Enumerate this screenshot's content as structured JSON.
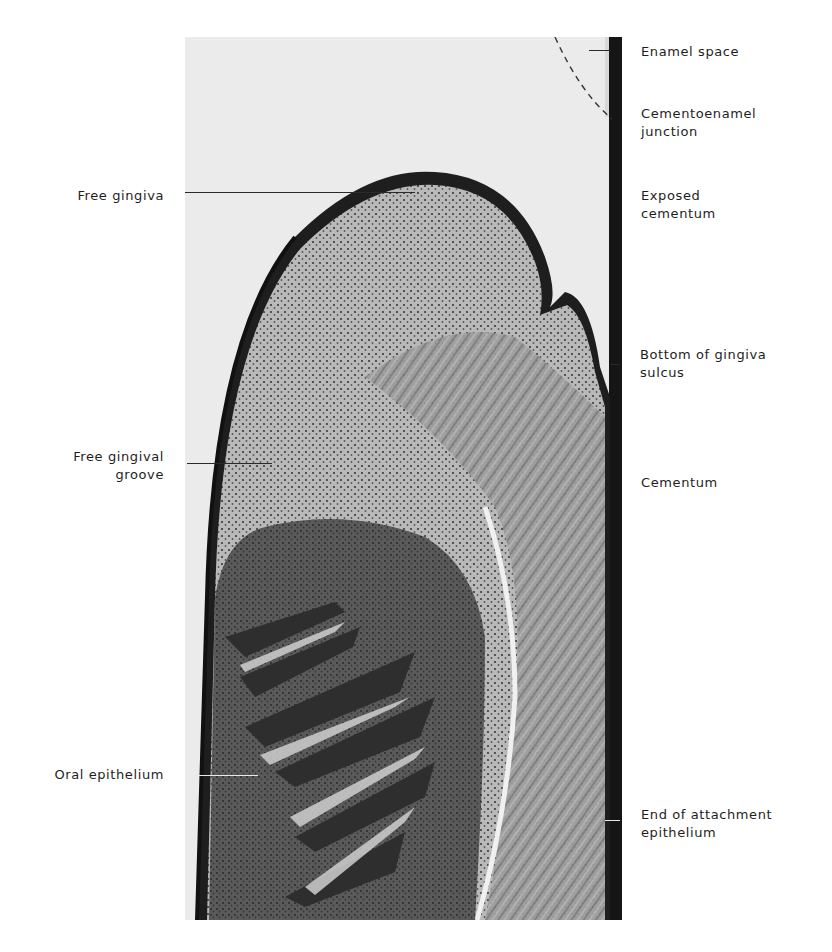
{
  "figure": {
    "type": "histological micrograph",
    "colors": {
      "background": "#ffffff",
      "photo_bg": "#ebebeb",
      "tissue_dark": "#2a2a2a",
      "tissue_mid": "#7a7a7a",
      "tissue_light": "#c8c8c8"
    }
  },
  "labels_left": [
    {
      "id": "free-gingiva",
      "lines": [
        "Free gingiva"
      ],
      "leader_color": "dark"
    },
    {
      "id": "free-gingival-groove",
      "lines": [
        "Free gingival",
        "groove"
      ],
      "leader_color": "dark"
    },
    {
      "id": "oral-epithelium",
      "lines": [
        "Oral epithelium"
      ],
      "leader_color": "light"
    }
  ],
  "labels_right": [
    {
      "id": "enamel-space",
      "lines": [
        "Enamel space"
      ],
      "leader_color": "dark"
    },
    {
      "id": "cementoenamel-junction",
      "lines": [
        "Cementoenamel",
        "junction"
      ]
    },
    {
      "id": "exposed-cementum",
      "lines": [
        "Exposed",
        "cementum"
      ]
    },
    {
      "id": "bottom-of-gingiva-sulcus",
      "lines": [
        "Bottom of gingiva",
        "sulcus"
      ],
      "leader_color": "dark"
    },
    {
      "id": "cementum",
      "lines": [
        "Cementum"
      ]
    },
    {
      "id": "end-of-attachment-epithelium",
      "lines": [
        "End of attachment",
        "epithelium"
      ],
      "leader_color": "light"
    }
  ]
}
